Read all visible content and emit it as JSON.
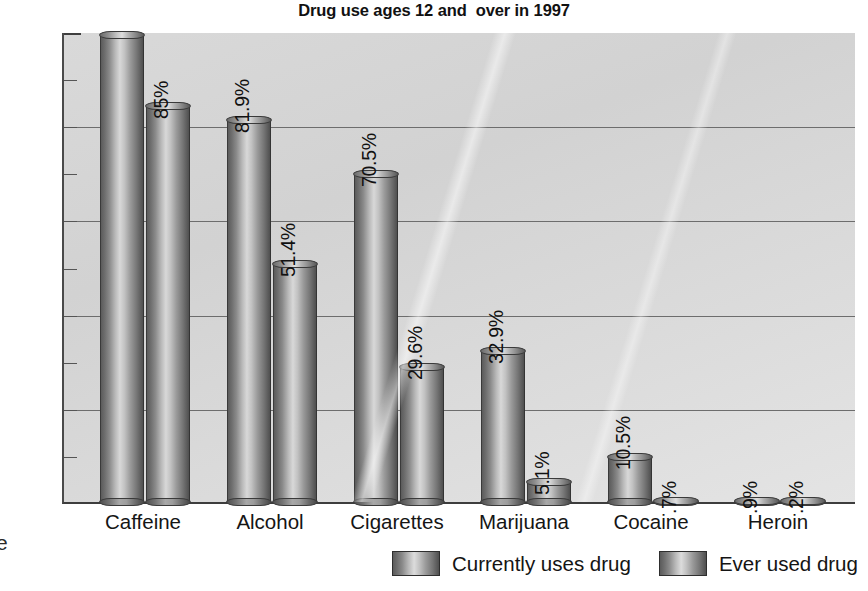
{
  "chart_data": {
    "type": "bar",
    "title": "Drug use ages 12 and  over in 1997",
    "xlabel": "",
    "ylabel": "",
    "ylim": [
      0,
      100
    ],
    "grid": true,
    "legend_position": "bottom-right",
    "categories": [
      "Caffeine",
      "Alcohol",
      "Cigarettes",
      "Marijuana",
      "Cocaine",
      "Heroin"
    ],
    "series": [
      {
        "name": "Currently uses drug",
        "values": [
          100,
          81.9,
          70.5,
          32.9,
          10.5,
          0.9
        ],
        "value_labels": [
          "",
          "81.9%",
          "70.5%",
          "32.9%",
          "10.5%",
          ".9%"
        ]
      },
      {
        "name": "Ever used drug",
        "values": [
          85,
          51.4,
          29.6,
          5.1,
          0.7,
          0.2
        ],
        "value_labels": [
          "85%",
          "51.4%",
          "29.6%",
          "5.1%",
          ".7%",
          ".2%"
        ]
      }
    ],
    "ytick_labels": [
      "100%",
      "90%",
      "80%",
      "70%",
      "60%",
      "50%",
      "40%",
      "30%",
      "20%",
      "10%",
      "0%"
    ],
    "ytick_values": [
      100,
      90,
      80,
      70,
      60,
      50,
      40,
      30,
      20,
      10,
      0
    ],
    "colors": {
      "bar_light": "#d8d8d8",
      "bar_dark": "#4f4f4f",
      "plot_background": "#d9d9d9",
      "gridline": "#6d6d6d",
      "text": "#111111"
    }
  },
  "legend": {
    "entries": [
      {
        "label": "Currently uses drug"
      },
      {
        "label": "Ever used drug"
      }
    ]
  },
  "margin": {
    "fragment": "e"
  }
}
